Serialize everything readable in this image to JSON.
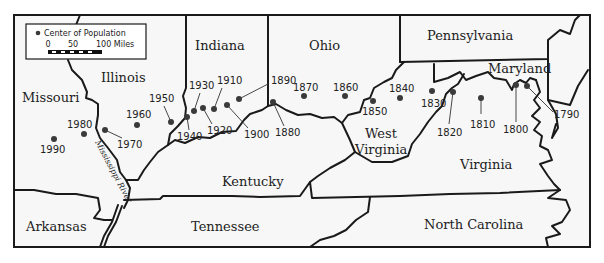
{
  "legend": {
    "marker_label": "Center of Population",
    "scale_ticks": [
      "0",
      "50",
      "100 Miles"
    ]
  },
  "states": {
    "missouri": "Missouri",
    "illinois": "Illinois",
    "indiana": "Indiana",
    "ohio": "Ohio",
    "pennsylvania": "Pennsylvania",
    "maryland": "Maryland",
    "west_virginia_1": "West",
    "west_virginia_2": "Virginia",
    "virginia": "Virginia",
    "kentucky": "Kentucky",
    "tennessee": "Tennessee",
    "north_carolina": "North Carolina",
    "arkansas": "Arkansas"
  },
  "river_label": "Mississippi River",
  "centers": [
    {
      "year": "1790",
      "x": 527,
      "y": 86
    },
    {
      "year": "1800",
      "x": 516,
      "y": 85
    },
    {
      "year": "1810",
      "x": 481,
      "y": 98
    },
    {
      "year": "1820",
      "x": 453,
      "y": 92
    },
    {
      "year": "1830",
      "x": 432,
      "y": 91
    },
    {
      "year": "1840",
      "x": 400,
      "y": 98
    },
    {
      "year": "1850",
      "x": 373,
      "y": 101
    },
    {
      "year": "1860",
      "x": 345,
      "y": 96
    },
    {
      "year": "1870",
      "x": 304,
      "y": 96
    },
    {
      "year": "1880",
      "x": 273,
      "y": 102
    },
    {
      "year": "1890",
      "x": 239,
      "y": 99
    },
    {
      "year": "1900",
      "x": 227,
      "y": 105
    },
    {
      "year": "1910",
      "x": 214,
      "y": 109
    },
    {
      "year": "1920",
      "x": 203,
      "y": 108
    },
    {
      "year": "1930",
      "x": 194,
      "y": 111
    },
    {
      "year": "1940",
      "x": 187,
      "y": 117
    },
    {
      "year": "1950",
      "x": 171,
      "y": 122
    },
    {
      "year": "1960",
      "x": 137,
      "y": 125
    },
    {
      "year": "1970",
      "x": 105,
      "y": 130
    },
    {
      "year": "1980",
      "x": 84,
      "y": 134
    },
    {
      "year": "1990",
      "x": 54,
      "y": 139
    }
  ]
}
